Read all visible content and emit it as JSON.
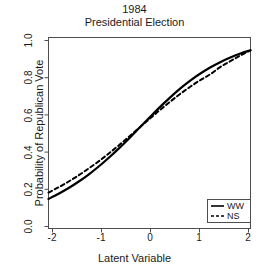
{
  "chart_data": {
    "type": "line",
    "title": "1984 Presidential Election",
    "title_lines": [
      "1984",
      "Presidential Election"
    ],
    "xlabel": "Latent Variable",
    "ylabel": "Probability of Republican Vote",
    "xlim": [
      -2,
      2
    ],
    "ylim": [
      0,
      1
    ],
    "xticks": [
      -2,
      -1,
      0,
      1,
      2
    ],
    "xtick_labels": [
      "-2",
      "-1",
      "0",
      "1",
      "2"
    ],
    "yticks": [
      0.0,
      0.2,
      0.4,
      0.6,
      0.8,
      1.0
    ],
    "ytick_labels": [
      "0.0",
      "0.2",
      "0.4",
      "0.6",
      "0.8",
      "1.0"
    ],
    "grid": false,
    "box": true,
    "legend_position": "bottom-right",
    "series": [
      {
        "name": "WW",
        "style": "solid",
        "color": "#000000",
        "x": [
          -2.0,
          -1.8,
          -1.6,
          -1.4,
          -1.2,
          -1.0,
          -0.8,
          -0.6,
          -0.4,
          -0.2,
          0.0,
          0.2,
          0.4,
          0.6,
          0.8,
          1.0,
          1.2,
          1.4,
          1.6,
          1.8,
          2.0
        ],
        "y": [
          0.155,
          0.182,
          0.212,
          0.246,
          0.284,
          0.326,
          0.372,
          0.421,
          0.473,
          0.527,
          0.581,
          0.634,
          0.684,
          0.731,
          0.773,
          0.81,
          0.843,
          0.871,
          0.895,
          0.916,
          0.933
        ]
      },
      {
        "name": "NS",
        "style": "dashed",
        "color": "#000000",
        "x": [
          -2.0,
          -1.8,
          -1.6,
          -1.4,
          -1.2,
          -1.0,
          -0.8,
          -0.6,
          -0.4,
          -0.2,
          0.0,
          0.2,
          0.4,
          0.6,
          0.8,
          1.0,
          1.2,
          1.4,
          1.6,
          1.8,
          2.0
        ],
        "y": [
          0.188,
          0.216,
          0.246,
          0.279,
          0.315,
          0.353,
          0.394,
          0.437,
          0.482,
          0.528,
          0.574,
          0.619,
          0.662,
          0.703,
          0.741,
          0.776,
          0.807,
          0.845,
          0.876,
          0.906,
          0.933
        ]
      }
    ],
    "legend": [
      {
        "label": "WW",
        "style": "solid"
      },
      {
        "label": "NS",
        "style": "dashed"
      }
    ]
  },
  "axis": {
    "x_tick_labels": [
      "-2",
      "-1",
      "0",
      "1",
      "2"
    ],
    "y_tick_labels": [
      "0.0",
      "0.2",
      "0.4",
      "0.6",
      "0.8",
      "1.0"
    ]
  }
}
